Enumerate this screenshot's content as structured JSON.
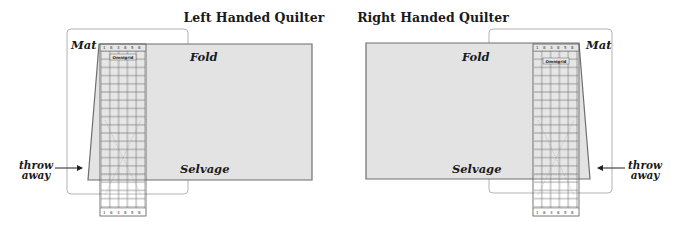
{
  "panels": [
    {
      "id": "left",
      "title": "Left Handed Quilter",
      "labels": {
        "mat": "Mat",
        "fold": "Fold",
        "selvage": "Selvage",
        "throw_away_line1": "throw",
        "throw_away_line2": "away"
      },
      "ruler": {
        "brand": "Omnigrid",
        "top_numbers": [
          "1",
          "8",
          "3",
          "8",
          "5",
          "8"
        ],
        "bottom_numbers": [
          "1",
          "8",
          "3",
          "8",
          "5",
          "8"
        ]
      }
    },
    {
      "id": "right",
      "title": "Right Handed Quilter",
      "labels": {
        "mat": "Mat",
        "fold": "Fold",
        "selvage": "Selvage",
        "throw_away_line1": "throw",
        "throw_away_line2": "away"
      },
      "ruler": {
        "brand": "Omnigrid",
        "top_numbers": [
          "1",
          "8",
          "3",
          "8",
          "5",
          "8"
        ],
        "bottom_numbers": [
          "1",
          "8",
          "3",
          "8",
          "5",
          "8"
        ]
      }
    }
  ],
  "colors": {
    "fabric_fill": "#e3e3e3",
    "fabric_stroke": "#6e6e6e",
    "mat_stroke": "#b3b3b3",
    "text": "#1a1a1a"
  }
}
